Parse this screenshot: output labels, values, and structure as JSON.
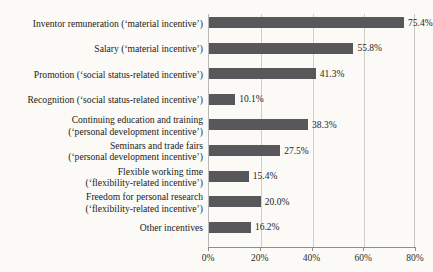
{
  "chart_data": {
    "type": "bar",
    "orientation": "horizontal",
    "title": "",
    "xlabel": "",
    "ylabel": "",
    "xlim": [
      0,
      80
    ],
    "grid": true,
    "legend": false,
    "tick_labels": [
      "0%",
      "20%",
      "40%",
      "60%",
      "80%"
    ],
    "tick_values": [
      0,
      20,
      40,
      60,
      80
    ],
    "bar_color": "#58585a",
    "categories": [
      "Inventor remuneration (‘material incentive’)",
      "Salary (‘material incentive’)",
      "Promotion (‘social status-related incentive’)",
      "Recognition (‘social status-related incentive’)",
      "Continuing education and training\n(‘personal development incentive’)",
      "Seminars and trade fairs\n(‘personal development incentive’)",
      "Flexible working time\n(‘flexibility-related incentive’)",
      "Freedom for personal research\n(‘flexibility-related incentive’)",
      "Other incentives"
    ],
    "values": [
      75.4,
      55.8,
      41.3,
      10.1,
      38.3,
      27.5,
      15.4,
      20.0,
      16.2
    ],
    "value_labels": [
      "75.4%",
      "55.8%",
      "41.3%",
      "10.1%",
      "38.3%",
      "27.5%",
      "15.4%",
      "20.0%",
      "16.2%"
    ]
  }
}
